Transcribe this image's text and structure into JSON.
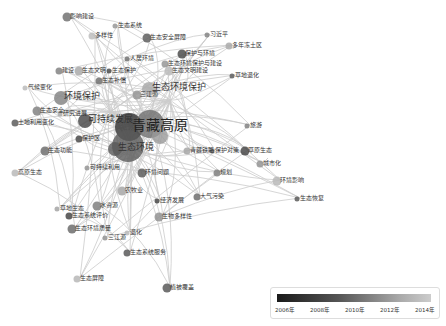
{
  "diagram": {
    "type": "keyword co-occurrence network",
    "center_labels": [
      "青藏高原",
      "生态环境"
    ],
    "labels": [
      {
        "text": "青藏高原",
        "x": 132,
        "y": 126,
        "size": "big"
      },
      {
        "text": "生态环境",
        "x": 118,
        "y": 148,
        "size": "mid"
      },
      {
        "text": "环境保护",
        "x": 64,
        "y": 97,
        "size": "mid"
      },
      {
        "text": "生态环境保护",
        "x": 152,
        "y": 88,
        "size": "mid"
      },
      {
        "text": "可持续发展",
        "x": 88,
        "y": 120,
        "size": "mid"
      },
      {
        "text": "影响建设",
        "x": 70,
        "y": 16
      },
      {
        "text": "生态系统",
        "x": 118,
        "y": 25
      },
      {
        "text": "多样性",
        "x": 95,
        "y": 35
      },
      {
        "text": "生态安全屏障",
        "x": 150,
        "y": 37
      },
      {
        "text": "习近平",
        "x": 210,
        "y": 34
      },
      {
        "text": "多年冻土区",
        "x": 232,
        "y": 45
      },
      {
        "text": "保护与环境",
        "x": 185,
        "y": 53
      },
      {
        "text": "人居环境",
        "x": 130,
        "y": 58
      },
      {
        "text": "生态环境保护与建设",
        "x": 168,
        "y": 63
      },
      {
        "text": "生态文明建设",
        "x": 172,
        "y": 70
      },
      {
        "text": "草地退化",
        "x": 235,
        "y": 75
      },
      {
        "text": "建设",
        "x": 62,
        "y": 70
      },
      {
        "text": "生态文明",
        "x": 82,
        "y": 70
      },
      {
        "text": "生态保护",
        "x": 112,
        "y": 70
      },
      {
        "text": "生态补偿",
        "x": 102,
        "y": 80
      },
      {
        "text": "三江源",
        "x": 140,
        "y": 94
      },
      {
        "text": "气候变化",
        "x": 28,
        "y": 87
      },
      {
        "text": "土地利用变化",
        "x": 18,
        "y": 122
      },
      {
        "text": "生态安全",
        "x": 40,
        "y": 110
      },
      {
        "text": "研究进展",
        "x": 63,
        "y": 113
      },
      {
        "text": "保护区",
        "x": 82,
        "y": 138
      },
      {
        "text": "生态功能",
        "x": 48,
        "y": 150
      },
      {
        "text": "可持续利用",
        "x": 90,
        "y": 167
      },
      {
        "text": "高原生态",
        "x": 18,
        "y": 172
      },
      {
        "text": "环境问题",
        "x": 145,
        "y": 172
      },
      {
        "text": "旅游",
        "x": 250,
        "y": 125
      },
      {
        "text": "青藏铁路",
        "x": 190,
        "y": 150
      },
      {
        "text": "草原生态",
        "x": 248,
        "y": 150
      },
      {
        "text": "保护对策",
        "x": 215,
        "y": 150
      },
      {
        "text": "城市化",
        "x": 263,
        "y": 163
      },
      {
        "text": "环境影响",
        "x": 280,
        "y": 180
      },
      {
        "text": "生态恢复",
        "x": 300,
        "y": 198
      },
      {
        "text": "规划",
        "x": 220,
        "y": 172
      },
      {
        "text": "农牧业",
        "x": 125,
        "y": 190
      },
      {
        "text": "经济发展",
        "x": 160,
        "y": 200
      },
      {
        "text": "大气污染",
        "x": 200,
        "y": 196
      },
      {
        "text": "生物多样性",
        "x": 162,
        "y": 216
      },
      {
        "text": "退化",
        "x": 130,
        "y": 232
      },
      {
        "text": "生态系统服务",
        "x": 130,
        "y": 252
      },
      {
        "text": "水资源",
        "x": 100,
        "y": 205
      },
      {
        "text": "草地生态",
        "x": 60,
        "y": 208
      },
      {
        "text": "生态系统评价",
        "x": 72,
        "y": 215
      },
      {
        "text": "生态环境质量",
        "x": 75,
        "y": 228
      },
      {
        "text": "三江源",
        "x": 108,
        "y": 237
      },
      {
        "text": "生态屏障",
        "x": 80,
        "y": 278
      },
      {
        "text": "植被覆盖",
        "x": 170,
        "y": 287
      }
    ]
  },
  "legend": {
    "ticks": [
      "2006年",
      "2008年",
      "2010年",
      "2012年",
      "2014年"
    ],
    "colors": {
      "start": "#1a1a1a",
      "end": "#cccccc"
    }
  }
}
